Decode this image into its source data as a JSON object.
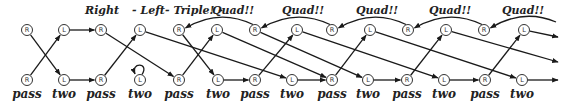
{
  "diagram": {
    "titles": [
      {
        "text": "Right",
        "x": 85,
        "y": 14
      },
      {
        "text": "- Left",
        "x": 132,
        "y": 14
      },
      {
        "text": "- Triple! -",
        "x": 165,
        "y": 14
      },
      {
        "text": "Quad!!",
        "x": 212,
        "y": 14
      },
      {
        "text": "Quad!!",
        "x": 282,
        "y": 14
      },
      {
        "text": "Quad!!",
        "x": 356,
        "y": 14
      },
      {
        "text": "Quad!!",
        "x": 429,
        "y": 14
      },
      {
        "text": "Quad!!",
        "x": 502,
        "y": 14
      }
    ],
    "top_nodes": [
      {
        "id": "t0",
        "letter": "R",
        "x": 27,
        "y": 30
      },
      {
        "id": "t1",
        "letter": "L",
        "x": 64,
        "y": 30
      },
      {
        "id": "t2",
        "letter": "R",
        "x": 101,
        "y": 30
      },
      {
        "id": "t3",
        "letter": "L",
        "x": 140,
        "y": 30
      },
      {
        "id": "t4",
        "letter": "R",
        "x": 179,
        "y": 30
      },
      {
        "id": "t5",
        "letter": "L",
        "x": 217,
        "y": 30
      },
      {
        "id": "t6",
        "letter": "R",
        "x": 255,
        "y": 30
      },
      {
        "id": "t7",
        "letter": "L",
        "x": 297,
        "y": 30
      },
      {
        "id": "t8",
        "letter": "R",
        "x": 332,
        "y": 30
      },
      {
        "id": "t9",
        "letter": "L",
        "x": 370,
        "y": 30
      },
      {
        "id": "t10",
        "letter": "R",
        "x": 408,
        "y": 30
      },
      {
        "id": "t11",
        "letter": "L",
        "x": 446,
        "y": 30
      },
      {
        "id": "t12",
        "letter": "R",
        "x": 484,
        "y": 30
      },
      {
        "id": "t13",
        "letter": "L",
        "x": 524,
        "y": 30
      }
    ],
    "bottom_nodes": [
      {
        "id": "b0",
        "letter": "R",
        "x": 27,
        "y": 80,
        "label": "pass"
      },
      {
        "id": "b1",
        "letter": "L",
        "x": 64,
        "y": 80,
        "label": "two"
      },
      {
        "id": "b2",
        "letter": "R",
        "x": 101,
        "y": 80,
        "label": "pass"
      },
      {
        "id": "b3",
        "letter": "L",
        "x": 140,
        "y": 80,
        "label": "two"
      },
      {
        "id": "b4",
        "letter": "R",
        "x": 179,
        "y": 80,
        "label": "pass"
      },
      {
        "id": "b5",
        "letter": "L",
        "x": 218,
        "y": 80,
        "label": "two"
      },
      {
        "id": "b6",
        "letter": "R",
        "x": 255,
        "y": 80,
        "label": "pass"
      },
      {
        "id": "b7",
        "letter": "L",
        "x": 292,
        "y": 80,
        "label": "two"
      },
      {
        "id": "b8",
        "letter": "R",
        "x": 332,
        "y": 80,
        "label": "pass"
      },
      {
        "id": "b9",
        "letter": "L",
        "x": 368,
        "y": 80,
        "label": "two"
      },
      {
        "id": "b10",
        "letter": "R",
        "x": 407,
        "y": 80,
        "label": "pass"
      },
      {
        "id": "b11",
        "letter": "L",
        "x": 444,
        "y": 80,
        "label": "two"
      },
      {
        "id": "b12",
        "letter": "R",
        "x": 485,
        "y": 80,
        "label": "pass"
      },
      {
        "id": "b13",
        "letter": "L",
        "x": 522,
        "y": 80,
        "label": "two"
      }
    ],
    "edges": [
      {
        "from": "b0",
        "to": "t1"
      },
      {
        "from": "t0",
        "to": "b1"
      },
      {
        "from": "t1",
        "to": "t2"
      },
      {
        "from": "b1",
        "to": "b2"
      },
      {
        "from": "b2",
        "to": "t3"
      },
      {
        "from": "t2",
        "to": "b4"
      },
      {
        "from": "t3",
        "to": "b7"
      },
      {
        "from": "b4",
        "to": "t5"
      },
      {
        "from": "t4",
        "to": "b5"
      },
      {
        "from": "b5",
        "to": "b6"
      },
      {
        "from": "b6",
        "to": "t7"
      },
      {
        "from": "t5",
        "to": "b8"
      },
      {
        "from": "b7",
        "to": "b8"
      },
      {
        "from": "t7",
        "to": "b11"
      },
      {
        "from": "b8",
        "to": "t9"
      },
      {
        "from": "t6",
        "to": "b9"
      },
      {
        "from": "b9",
        "to": "b10"
      },
      {
        "from": "b10",
        "to": "t11"
      },
      {
        "from": "t9",
        "to": "b13"
      },
      {
        "from": "b11",
        "to": "b12"
      },
      {
        "from": "b12",
        "to": "t13"
      },
      {
        "from": "b13",
        "to": "end_b"
      },
      {
        "from": "t13",
        "to": "end_t"
      },
      {
        "from": "t11",
        "to": "end_m"
      }
    ],
    "curved_edges": [
      {
        "from": "t6",
        "to": "t4"
      },
      {
        "from": "t8",
        "to": "t6"
      },
      {
        "from": "t10",
        "to": "t8"
      },
      {
        "from": "t12",
        "to": "t10"
      },
      {
        "from": "offscreen",
        "to": "t12"
      }
    ],
    "self_loop": {
      "node": "b3"
    }
  }
}
